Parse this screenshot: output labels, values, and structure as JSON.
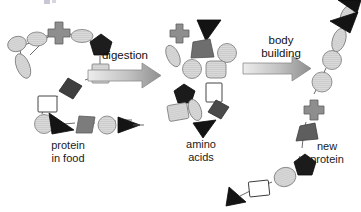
{
  "figure": {
    "background_color": "#ffffff",
    "width": 361,
    "height": 212
  },
  "labels": {
    "protein_in_food": "protein\nin food",
    "amino_acids": "amino\nacids",
    "new_protein": "new\nprotein",
    "digestion": "digestion",
    "body_building": "body\nbuilding"
  },
  "palette": {
    "black": "#1a1a1a",
    "dark_gray": "#3d3d3d",
    "mid_gray": "#6e6e6e",
    "light_gray": "#c9c9c9",
    "pale_gray": "#d8d8d8",
    "white": "#ffffff",
    "outline": "#4a4a4a",
    "arrow_fill_start": "#e8e8e8",
    "arrow_fill_end": "#9a9a9a",
    "text": "#1a1a1a"
  },
  "stages": [
    {
      "name": "protein-in-food",
      "label": "protein in food",
      "description": "Folded chain of linked amino-acid shapes representing dietary protein",
      "shape_count": 12
    },
    {
      "name": "amino-acids",
      "label": "amino acids",
      "description": "Loose, unlinked amino-acid shapes scattered after digestion",
      "shape_count": 14
    },
    {
      "name": "new-protein",
      "label": "new protein",
      "description": "Newly assembled chain of amino-acid shapes rising to the upper right",
      "shape_count": 12
    }
  ],
  "arrows": [
    {
      "name": "digestion-arrow",
      "label": "digestion",
      "direction": "right"
    },
    {
      "name": "body-building-arrow",
      "label": "body building",
      "direction": "right"
    }
  ]
}
